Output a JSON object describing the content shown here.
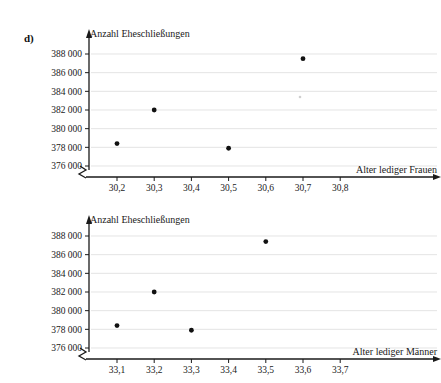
{
  "page": {
    "part_label": "d)"
  },
  "chart_data": [
    {
      "id": "top",
      "type": "scatter",
      "title": "",
      "ylabel": "Anzahl Eheschließungen",
      "xlabel": "Alter lediger Frauen",
      "xlim": [
        30.15,
        30.85
      ],
      "ylim": [
        375000,
        389000
      ],
      "grid": true,
      "legend": "none",
      "xticks": [
        "30,2",
        "30,3",
        "30,4",
        "30,5",
        "30,6",
        "30,7",
        "30,8"
      ],
      "xtick_values": [
        30.2,
        30.3,
        30.4,
        30.5,
        30.6,
        30.7,
        30.8
      ],
      "yticks": [
        "376 000",
        "378 000",
        "380 000",
        "382 000",
        "384 000",
        "386 000",
        "388 000"
      ],
      "ytick_values": [
        376000,
        378000,
        380000,
        382000,
        384000,
        386000,
        388000
      ],
      "x": [
        30.2,
        30.3,
        30.5,
        30.7
      ],
      "y": [
        378400,
        382000,
        377900,
        387500
      ],
      "axis_break": true
    },
    {
      "id": "bottom",
      "type": "scatter",
      "title": "",
      "ylabel": "Anzahl Eheschließungen",
      "xlabel": "Alter lediger Männer",
      "xlim": [
        33.05,
        33.75
      ],
      "ylim": [
        375000,
        389000
      ],
      "grid": true,
      "legend": "none",
      "xticks": [
        "33,1",
        "33,2",
        "33,3",
        "33,4",
        "33,5",
        "33,6",
        "33,7"
      ],
      "xtick_values": [
        33.1,
        33.2,
        33.3,
        33.4,
        33.5,
        33.6,
        33.7
      ],
      "yticks": [
        "376 000",
        "378 000",
        "380 000",
        "382 000",
        "384 000",
        "386 000",
        "388 000"
      ],
      "ytick_values": [
        376000,
        378000,
        380000,
        382000,
        384000,
        386000,
        388000
      ],
      "x": [
        33.1,
        33.2,
        33.3,
        33.5
      ],
      "y": [
        378400,
        382000,
        377900,
        387400
      ],
      "axis_break": true
    }
  ]
}
